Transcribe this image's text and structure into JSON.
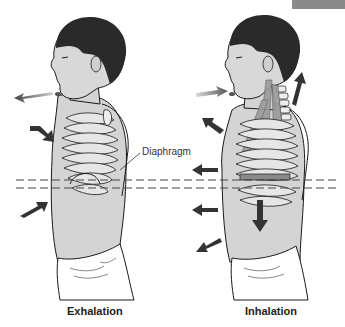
{
  "figure": {
    "panels": [
      {
        "id": "exhalation",
        "caption": "Exhalation",
        "air_flow": "out of mouth",
        "chest_arrows": "inward"
      },
      {
        "id": "inhalation",
        "caption": "Inhalation",
        "air_flow": "into mouth",
        "chest_arrows": "outward",
        "diaphragm_arrow": "downward",
        "neck_arrows": "upward"
      }
    ],
    "annotation": {
      "diaphragm_label": "Diaphragm"
    },
    "reference_lines": {
      "style": "dashed",
      "count": 2
    }
  },
  "colors": {
    "background": "#ffffff",
    "skin": "#d4d4d4",
    "hair": "#2a2a2a",
    "arrow": "#333333",
    "outline": "#1a1a1a",
    "muscle": "#9a9a9a",
    "corner_block": "#8a8a8a"
  }
}
